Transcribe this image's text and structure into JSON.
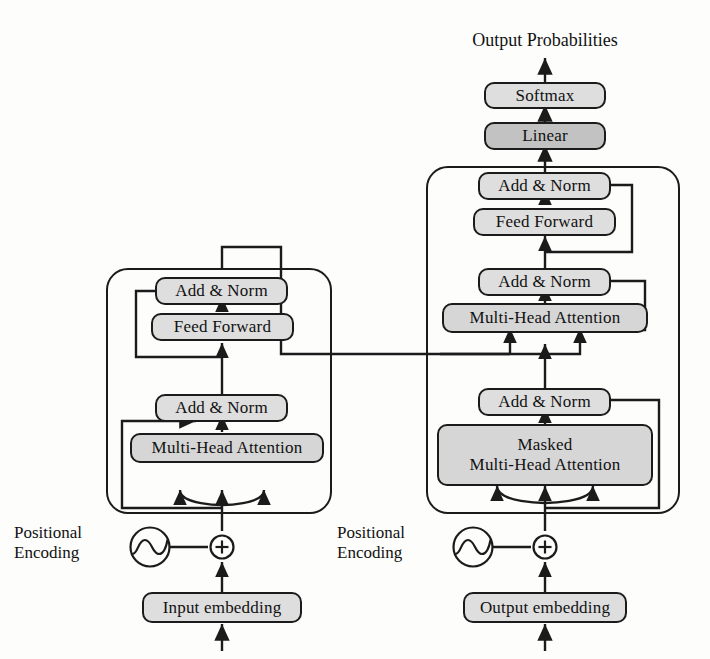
{
  "figure": {
    "title_top": "Output Probabilities",
    "domain": "transformer-architecture"
  },
  "colors": {
    "stroke": "#1b1b1b",
    "box_light": "#dedede",
    "box_mid": "#d6d6d6",
    "box_dark": "#c2c2c2",
    "background": "#fdfdfc"
  },
  "output_stack": {
    "probabilities_label": "Output Probabilities",
    "softmax_label": "Softmax",
    "linear_label": "Linear"
  },
  "encoder": {
    "add_norm_upper_label": "Add & Norm",
    "feed_forward_label": "Feed Forward",
    "add_norm_lower_label": "Add & Norm",
    "attention_label": "Multi-Head Attention",
    "positional_encoding_label": "Positional\nEncoding",
    "embedding_label": "Input embedding",
    "add_symbol": "+",
    "pe_icon_name": "sinusoid-icon"
  },
  "decoder": {
    "add_norm_top_label": "Add & Norm",
    "feed_forward_label": "Feed Forward",
    "add_norm_mid_label": "Add & Norm",
    "cross_attention_label": "Multi-Head Attention",
    "add_norm_bottom_label": "Add & Norm",
    "masked_attention_line1": "Masked",
    "masked_attention_line2": "Multi-Head Attention",
    "positional_encoding_label": "Positional\nEncoding",
    "embedding_label": "Output embedding",
    "add_symbol": "+",
    "pe_icon_name": "sinusoid-icon"
  }
}
